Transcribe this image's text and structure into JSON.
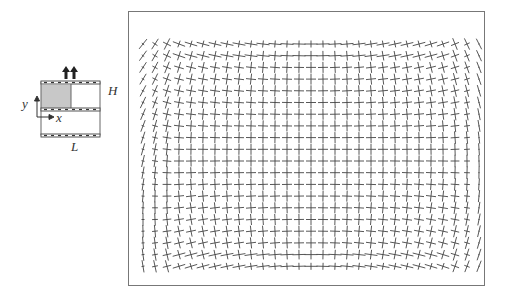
{
  "schematic": {
    "labels": {
      "height": "H",
      "length": "L",
      "x_axis": "x",
      "y_axis": "y"
    },
    "colors": {
      "shaded_region": "#c8c8c8",
      "wall": "#555555",
      "outline": "#666666"
    },
    "icons": [
      "inflow-arrows-icon",
      "coordinate-axes-icon"
    ]
  },
  "field_plot": {
    "type": "cross-glyph vector field",
    "columns": 29,
    "rows": 20,
    "x_start": 143,
    "x_step": 12,
    "y_start": 44,
    "y_step": 11.7,
    "glyph_color": "#444444",
    "frame_color": "#777777"
  }
}
